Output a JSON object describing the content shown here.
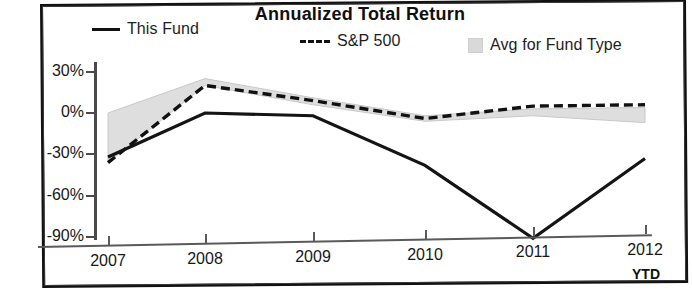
{
  "chart_data": {
    "type": "line",
    "title": "Annualized Total Return",
    "xlabel": "",
    "ylabel": "",
    "x": [
      "2007",
      "2008",
      "2009",
      "2010",
      "2011",
      "2012"
    ],
    "categories": [
      "2007",
      "2008",
      "2009",
      "2010",
      "2011",
      "2012"
    ],
    "xtick_suffix": "YTD",
    "ylim": [
      -100,
      40
    ],
    "yticks": [
      30,
      0,
      -30,
      -60,
      -90
    ],
    "ytick_labels": [
      "30%",
      "0%",
      "-30%",
      "-60%",
      "-90%"
    ],
    "grid": false,
    "legend_position": "top",
    "series": [
      {
        "name": "This Fund",
        "style": "solid",
        "color": "#111111",
        "values": [
          -32,
          0,
          -2,
          -38,
          -91,
          -33
        ]
      },
      {
        "name": "S&P 500",
        "style": "dashed",
        "color": "#111111",
        "values": [
          -36,
          20,
          9,
          -4,
          5,
          6
        ]
      },
      {
        "name": "Avg for Fund Type",
        "style": "band",
        "color": "#d9d9d9",
        "upper": [
          0,
          25,
          11,
          -2,
          3,
          4
        ],
        "lower": [
          -36,
          20,
          6,
          -6,
          -2,
          -7
        ]
      }
    ]
  },
  "legend": {
    "items": [
      {
        "label": "This Fund",
        "marker": "solid-line-swatch"
      },
      {
        "label": "S&P 500",
        "marker": "dashed-line-swatch"
      },
      {
        "label": "Avg for Fund Type",
        "marker": "gray-box-swatch"
      }
    ]
  },
  "axis": {
    "y_labels": [
      "30%",
      "0%",
      "-30%",
      "-60%",
      "-90%"
    ],
    "x_labels": [
      "2007",
      "2008",
      "2009",
      "2010",
      "2011",
      "2012"
    ],
    "ytd": "YTD"
  },
  "title": "Annualized Total Return"
}
